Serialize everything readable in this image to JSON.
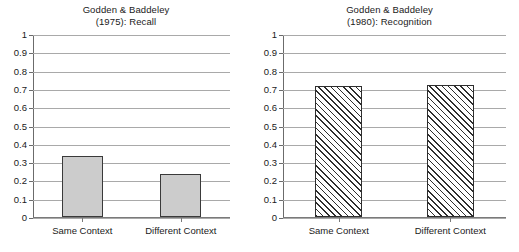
{
  "figure": {
    "background_color": "#ffffff",
    "panel_count": 2
  },
  "chart_data": [
    {
      "type": "bar",
      "panel": "left",
      "title": "Godden & Baddeley",
      "subtitle": "(1975): Recall",
      "title_line1": "Godden & Baddeley",
      "title_line2": "(1975): Recall",
      "categories": [
        "Same Context",
        "Different Context"
      ],
      "values": [
        0.34,
        0.24
      ],
      "xlabel": "",
      "ylabel": "",
      "ylim": [
        0,
        1
      ],
      "ytick_labels": [
        "0",
        "0.1",
        "0.2",
        "0.3",
        "0.4",
        "0.5",
        "0.6",
        "0.7",
        "0.8",
        "0.9",
        "1"
      ],
      "ytick_values": [
        0,
        0.1,
        0.2,
        0.3,
        0.4,
        0.5,
        0.6,
        0.7,
        0.8,
        0.9,
        1
      ],
      "grid": true,
      "legend": false,
      "bar_style": "solid",
      "bar_fill_color": "#cccccc",
      "bar_edge_color": "#3a3a3a",
      "gridline_color": "#a9a9a9"
    },
    {
      "type": "bar",
      "panel": "right",
      "title": "Godden & Baddeley",
      "subtitle": "(1980): Recognition",
      "title_line1": "Godden & Baddeley",
      "title_line2": "(1980): Recognition",
      "categories": [
        "Same Context",
        "Different Context"
      ],
      "values": [
        0.72,
        0.725
      ],
      "xlabel": "",
      "ylabel": "",
      "ylim": [
        0,
        1
      ],
      "ytick_labels": [
        "0",
        "0.1",
        "0.2",
        "0.3",
        "0.4",
        "0.5",
        "0.6",
        "0.7",
        "0.8",
        "0.9",
        "1"
      ],
      "ytick_values": [
        0,
        0.1,
        0.2,
        0.3,
        0.4,
        0.5,
        0.6,
        0.7,
        0.8,
        0.9,
        1
      ],
      "grid": true,
      "legend": false,
      "bar_style": "diagonal-hatch",
      "bar_fill_color": "#ffffff",
      "bar_edge_color": "#2e2e2e",
      "gridline_color": "#a9a9a9"
    }
  ]
}
